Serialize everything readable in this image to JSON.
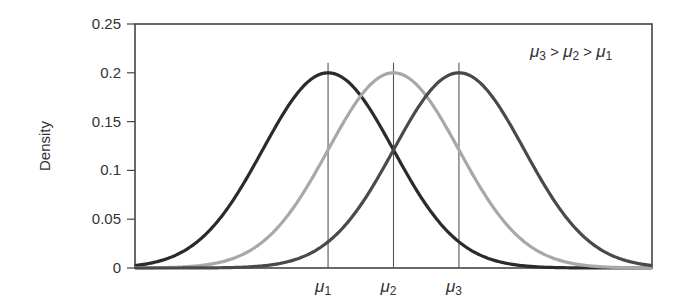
{
  "chart_data": {
    "type": "line",
    "title": "",
    "xlabel": "",
    "ylabel": "Density",
    "ylim": [
      0,
      0.25
    ],
    "xlim": [
      -7.9,
      7.9
    ],
    "yticks": [
      0,
      0.05,
      0.1,
      0.15,
      0.2,
      0.25
    ],
    "ytick_labels": [
      "0",
      "0.05",
      "0.1",
      "0.15",
      "0.2",
      "0.25"
    ],
    "xtick_labels": [
      "μ1",
      "μ2",
      "μ3"
    ],
    "grid": false,
    "legend": "none",
    "annotation": "μ3 > μ2 > μ1",
    "series": [
      {
        "name": "μ1",
        "distribution": "normal",
        "mean": -2,
        "sd": 1.995,
        "peak": 0.2,
        "color": "#2b2b2b"
      },
      {
        "name": "μ2",
        "distribution": "normal",
        "mean": 0,
        "sd": 1.995,
        "peak": 0.2,
        "color": "#a8a8a8"
      },
      {
        "name": "μ3",
        "distribution": "normal",
        "mean": 2,
        "sd": 1.995,
        "peak": 0.2,
        "color": "#4a4a4a"
      }
    ],
    "vertical_lines_at": [
      -2,
      0,
      2
    ]
  },
  "labels": {
    "ylabel": "Density",
    "mu": "μ",
    "gt": ">",
    "sub1": "1",
    "sub2": "2",
    "sub3": "3"
  }
}
